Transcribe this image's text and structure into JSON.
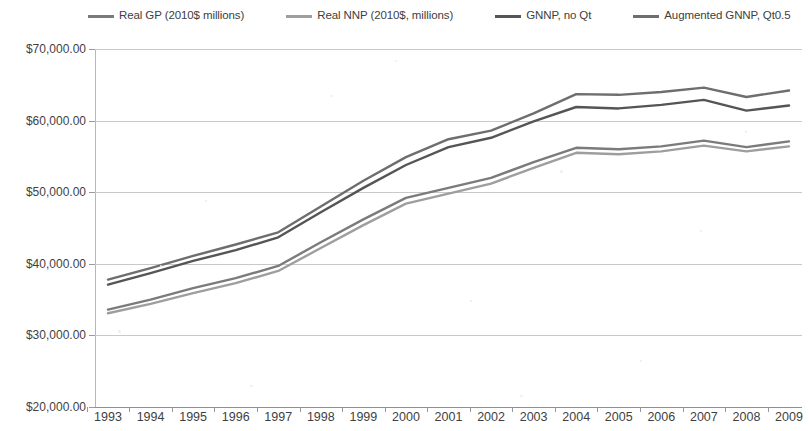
{
  "legend": {
    "items": [
      {
        "label": "Real GP (2010$ millions)",
        "color": "#7b7b7b"
      },
      {
        "label": "Real NNP (2010$, millions)",
        "color": "#9e9e9e"
      },
      {
        "label": "GNNP, no Qt",
        "color": "#555555"
      },
      {
        "label": "Augmented GNNP, Qt0.5",
        "color": "#6e6e6e"
      }
    ]
  },
  "axes": {
    "y_ticks": [
      "$70,000.00",
      "$60,000.00",
      "$50,000.00",
      "$40,000.00",
      "$30,000.00",
      "$20,000.00"
    ],
    "x_ticks": [
      "1993",
      "1994",
      "1995",
      "1996",
      "1997",
      "1998",
      "1999",
      "2000",
      "2001",
      "2002",
      "2003",
      "2004",
      "2005",
      "2006",
      "2007",
      "2008",
      "2009"
    ]
  },
  "chart_data": {
    "type": "line",
    "title": "",
    "xlabel": "",
    "ylabel": "",
    "ylim": [
      20000,
      70000
    ],
    "ytick_values": [
      70000,
      60000,
      50000,
      40000,
      30000,
      20000
    ],
    "grid": true,
    "legend_position": "top",
    "x": [
      1993,
      1994,
      1995,
      1996,
      1997,
      1998,
      1999,
      2000,
      2001,
      2002,
      2003,
      2004,
      2005,
      2006,
      2007,
      2008,
      2009
    ],
    "series": [
      {
        "name": "Real GP (2010$ millions)",
        "color": "#7b7b7b",
        "values": [
          33600,
          35000,
          36600,
          38000,
          39700,
          43000,
          46200,
          49200,
          50600,
          52000,
          54200,
          56200,
          56000,
          56400,
          57200,
          56300,
          57100
        ]
      },
      {
        "name": "Real NNP (2010$, millions)",
        "color": "#9e9e9e",
        "values": [
          33100,
          34400,
          35900,
          37300,
          39000,
          42200,
          45400,
          48400,
          49800,
          51200,
          53400,
          55500,
          55300,
          55700,
          56500,
          55700,
          56400
        ]
      },
      {
        "name": "GNNP, no Qt",
        "color": "#555555",
        "values": [
          37100,
          38700,
          40400,
          41900,
          43700,
          47200,
          50600,
          53800,
          56300,
          57600,
          59900,
          61900,
          61700,
          62200,
          62900,
          61400,
          62100
        ]
      },
      {
        "name": "Augmented GNNP, Qt0.5",
        "color": "#6e6e6e",
        "values": [
          37800,
          39400,
          41100,
          42700,
          44400,
          48000,
          51600,
          54900,
          57400,
          58600,
          61000,
          63700,
          63600,
          64000,
          64600,
          63300,
          64200
        ]
      }
    ]
  }
}
